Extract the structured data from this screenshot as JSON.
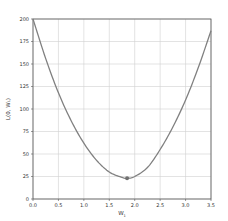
{
  "chart_data": {
    "type": "line",
    "title": "",
    "xlabel": "W_1",
    "ylabel": "L(0, W_1)",
    "xlim": [
      0.0,
      3.5
    ],
    "ylim": [
      0,
      200
    ],
    "grid": true,
    "legend": null,
    "xticks": [
      "0.0",
      "0.5",
      "1.0",
      "1.5",
      "2.0",
      "2.5",
      "3.0",
      "3.5"
    ],
    "yticks": [
      "0",
      "25",
      "50",
      "75",
      "100",
      "125",
      "150",
      "175",
      "200"
    ],
    "series": [
      {
        "name": "loss curve",
        "color": "#808080",
        "x": [
          0.0,
          0.25,
          0.5,
          0.75,
          1.0,
          1.25,
          1.5,
          1.75,
          1.85,
          2.0,
          2.25,
          2.5,
          2.75,
          3.0,
          3.25,
          3.5
        ],
        "y": [
          200,
          156,
          118,
          87,
          62,
          43,
          30,
          24,
          23,
          25,
          35,
          55,
          80,
          110,
          146,
          187
        ]
      }
    ],
    "annotations": [
      {
        "type": "marker",
        "label": "minimum",
        "x": 1.85,
        "y": 23,
        "color": "#707070"
      }
    ]
  },
  "labels": {
    "xlabel_main": "W",
    "xlabel_sub": "1",
    "ylabel": "L(0, W₁)"
  }
}
